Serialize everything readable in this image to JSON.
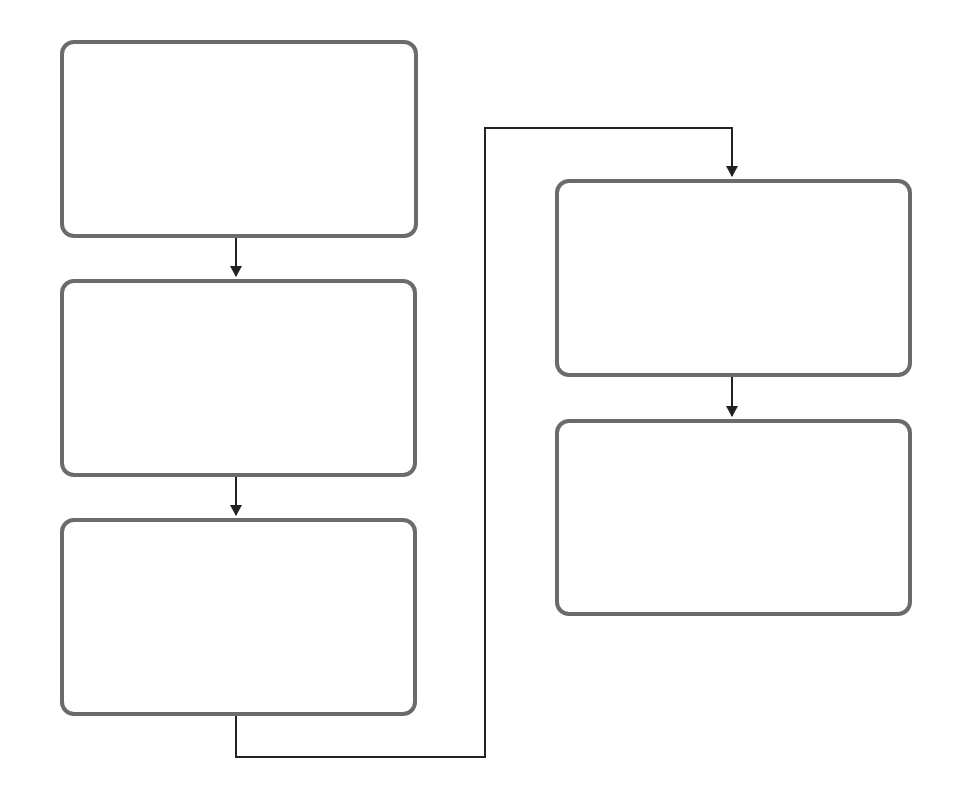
{
  "diagram": {
    "type": "flowchart",
    "colors": {
      "box_border": "#6b6b6b",
      "connector": "#222222",
      "background": "#ffffff"
    },
    "nodes": [
      {
        "id": "step-1",
        "label": "",
        "column": 1,
        "order": 1
      },
      {
        "id": "step-2",
        "label": "",
        "column": 1,
        "order": 2
      },
      {
        "id": "step-3",
        "label": "",
        "column": 1,
        "order": 3
      },
      {
        "id": "step-4",
        "label": "",
        "column": 2,
        "order": 4
      },
      {
        "id": "step-5",
        "label": "",
        "column": 2,
        "order": 5
      }
    ],
    "edges": [
      {
        "from": "step-1",
        "to": "step-2"
      },
      {
        "from": "step-2",
        "to": "step-3"
      },
      {
        "from": "step-3",
        "to": "step-4"
      },
      {
        "from": "step-4",
        "to": "step-5"
      }
    ]
  }
}
